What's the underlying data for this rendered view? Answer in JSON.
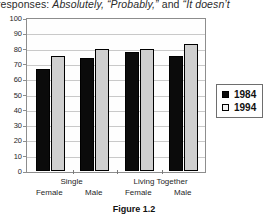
{
  "page": {
    "clipped_body_text": {
      "before": "ed responses:",
      "italic_1": "Absolutely,",
      "italic_2": "“Probably,”",
      "mid": "and",
      "italic_3": "“It doesn’t"
    },
    "figure_caption": "Figure 1.2"
  },
  "legend": {
    "position": "right",
    "items": [
      {
        "label": "1984",
        "color": "#0b0b0b"
      },
      {
        "label": "1994",
        "color": "#f2f2f2"
      }
    ]
  },
  "axis": {
    "y_ticks": [
      "100",
      "90",
      "80",
      "70",
      "60",
      "50",
      "40",
      "30",
      "20",
      "10",
      "0"
    ],
    "x_groups": [
      {
        "title": "Single",
        "subs": [
          "Female",
          "Male"
        ]
      },
      {
        "title": "Living Together",
        "subs": [
          "Female",
          "Male"
        ]
      }
    ]
  },
  "chart_data": {
    "type": "bar",
    "title": "",
    "subtitle": "",
    "xlabel": "",
    "ylabel": "",
    "ylim": [
      0,
      100
    ],
    "ytick_step": 10,
    "grid": true,
    "legend_position": "right",
    "categories": [
      "Single / Female",
      "Single / Male",
      "Living Together / Female",
      "Living Together / Male"
    ],
    "series": [
      {
        "name": "1984",
        "color": "#0b0b0b",
        "values": [
          67,
          74,
          78,
          75
        ]
      },
      {
        "name": "1994",
        "color": "#cfcfcf",
        "values": [
          75,
          80,
          80,
          83
        ]
      }
    ]
  }
}
